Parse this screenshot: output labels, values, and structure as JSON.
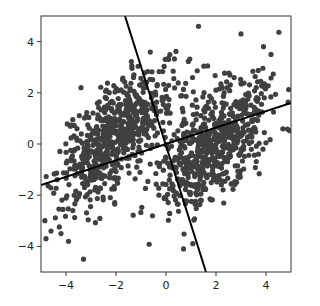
{
  "chart_data": {
    "type": "scatter",
    "title": "",
    "xlabel": "",
    "ylabel": "",
    "xlim": [
      -5,
      5
    ],
    "ylim": [
      -5,
      5
    ],
    "grid": false,
    "legend": null,
    "x_ticks": [
      -4,
      -2,
      0,
      2,
      4
    ],
    "y_ticks": [
      -4,
      -2,
      0,
      2,
      4
    ],
    "x_tick_labels": [
      "−4",
      "−2",
      "0",
      "2",
      "4"
    ],
    "y_tick_labels": [
      "−4",
      "−2",
      "0",
      "2",
      "4"
    ],
    "point_color": "#404040",
    "point_radius": 2.6,
    "clusters": [
      {
        "name": "left-cluster",
        "center": [
          -2.0,
          0.3
        ],
        "cov": [
          [
            1.3,
            0.9
          ],
          [
            0.9,
            1.6
          ]
        ],
        "n": 650,
        "seed": 7
      },
      {
        "name": "right-cluster",
        "center": [
          2.0,
          0.0
        ],
        "cov": [
          [
            1.3,
            0.9
          ],
          [
            0.9,
            1.6
          ]
        ],
        "n": 650,
        "seed": 13
      }
    ],
    "outliers": [
      [
        -4.8,
        -3.7
      ],
      [
        -3.3,
        -4.5
      ],
      [
        -4.6,
        -3.4
      ],
      [
        -4.2,
        -3.5
      ],
      [
        -3.9,
        -3.8
      ],
      [
        0.7,
        -4.1
      ],
      [
        1.3,
        4.6
      ],
      [
        0.1,
        3.3
      ],
      [
        3.0,
        4.3
      ],
      [
        3.9,
        3.8
      ],
      [
        -1.3,
        2.6
      ],
      [
        -3.4,
        2.2
      ],
      [
        4.2,
        3.5
      ]
    ],
    "lines": [
      {
        "name": "principal-axis-1",
        "points": [
          [
            -1.64,
            5.0
          ],
          [
            1.6,
            -5.0
          ]
        ],
        "color": "#000000",
        "width": 2
      },
      {
        "name": "principal-axis-2",
        "points": [
          [
            -5.0,
            -1.6
          ],
          [
            5.0,
            1.6
          ]
        ],
        "color": "#000000",
        "width": 2
      }
    ]
  },
  "plot_area": {
    "left": 41,
    "top": 16,
    "right": 291,
    "bottom": 272
  }
}
